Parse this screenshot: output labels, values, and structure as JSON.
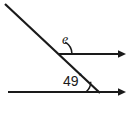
{
  "figure": {
    "type": "geometry-diagram",
    "background_color": "#ffffff",
    "stroke_color": "#1a1a1a",
    "labels": {
      "unknown_angle": "e",
      "known_angle_value": "49",
      "degree_symbol": "°"
    },
    "elements": {
      "transversal_line_name": "transversal",
      "upper_ray_name": "upper-horizontal-ray",
      "lower_ray_name": "lower-horizontal-ray",
      "upper_arc_name": "angle-arc-e",
      "lower_arc_name": "angle-arc-49"
    }
  }
}
